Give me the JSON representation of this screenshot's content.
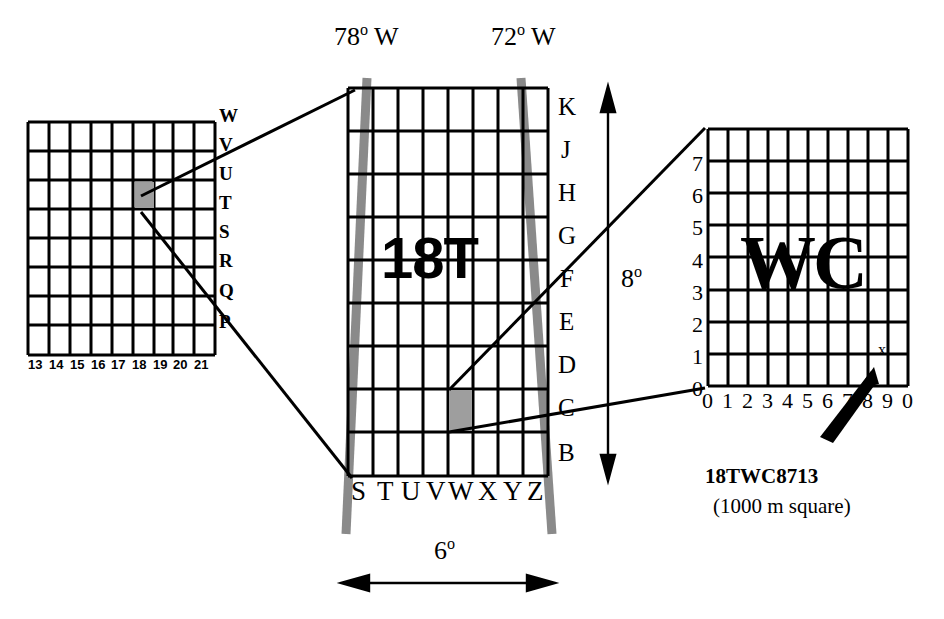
{
  "figure": {
    "colors": {
      "ink": "#000000",
      "paper": "#ffffff",
      "meridian": "#8a8a8a",
      "highlight": "#9e9e9e"
    }
  },
  "left_panel": {
    "name": "100000-metre-square-column-grid",
    "columns": 9,
    "rows": 8,
    "column_labels": [
      "13",
      "14",
      "15",
      "16",
      "17",
      "18",
      "19",
      "20",
      "21"
    ],
    "row_labels": [
      "W",
      "V",
      "U",
      "T",
      "S",
      "R",
      "Q",
      "P"
    ],
    "highlighted_cell": {
      "column": "18",
      "row": "T"
    }
  },
  "center_panel": {
    "name": "zone-18T-grid",
    "zone_label": "18T",
    "columns": 8,
    "rows": 9,
    "column_labels": [
      "S",
      "T",
      "U",
      "V",
      "W",
      "X",
      "Y",
      "Z"
    ],
    "row_labels": [
      "K",
      "J",
      "H",
      "G",
      "F",
      "E",
      "D",
      "C",
      "B"
    ],
    "meridian_left": "78",
    "meridian_left_hemisphere": "W",
    "meridian_right": "72",
    "meridian_right_hemisphere": "W",
    "meridian_left_label": "78 W",
    "meridian_right_label": "72 W",
    "width_value": "6",
    "width_label": "6",
    "height_value": "8",
    "height_label": "8",
    "degree_symbol": "o",
    "highlighted_cell": {
      "column": "W",
      "row": "C"
    }
  },
  "right_panel": {
    "name": "100000-metre-square-WC-grid",
    "square_label": "WC",
    "columns": 10,
    "rows": 8,
    "x_axis_labels": [
      "0",
      "1",
      "2",
      "3",
      "4",
      "5",
      "6",
      "7",
      "8",
      "9",
      "0"
    ],
    "y_axis_labels": [
      "0",
      "1",
      "2",
      "3",
      "4",
      "5",
      "6",
      "7"
    ],
    "point_marker": "x",
    "callout": {
      "grid_reference": "18TWC8713",
      "note": "(1000 m square)"
    }
  }
}
